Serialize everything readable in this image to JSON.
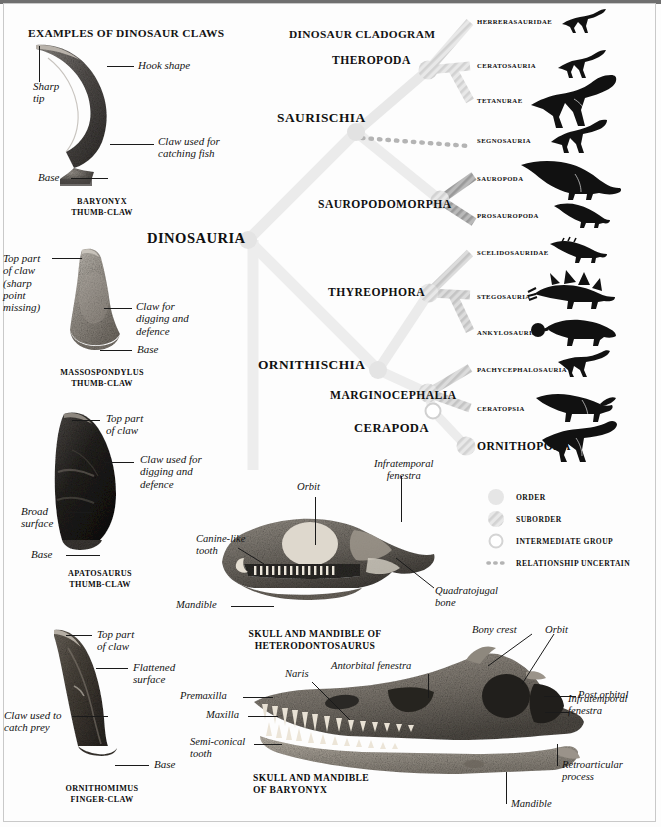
{
  "page": {
    "background": "#fdfdfd",
    "frame_color": "#c9c9c9",
    "top_bar_color": "#6f6f6f"
  },
  "claws_section": {
    "title": "EXAMPLES OF DINOSAUR CLAWS",
    "items": [
      {
        "caption_line1": "BARYONYX",
        "caption_line2": "THUMB-CLAW",
        "labels": [
          {
            "text": "Hook shape",
            "x": 138,
            "y": 62
          },
          {
            "text": "Sharp\ntip",
            "x": 33,
            "y": 82
          },
          {
            "text": "Claw used for\ncatching fish",
            "x": 158,
            "y": 137
          },
          {
            "text": "Base",
            "x": 38,
            "y": 172
          }
        ]
      },
      {
        "caption_line1": "MASSOSPONDYLUS",
        "caption_line2": "THUMB-CLAW",
        "labels": [
          {
            "text": "Top part\nof claw\n(sharp\npoint\nmissing)",
            "x": 3,
            "y": 255
          },
          {
            "text": "Claw for\ndigging and\ndefence",
            "x": 136,
            "y": 303
          },
          {
            "text": "Base",
            "x": 137,
            "y": 345
          }
        ]
      },
      {
        "caption_line1": "APATOSAURUS",
        "caption_line2": "THUMB-CLAW",
        "labels": [
          {
            "text": "Top part\nof claw",
            "x": 106,
            "y": 410
          },
          {
            "text": "Claw used for\ndigging and\ndefence",
            "x": 140,
            "y": 452
          },
          {
            "text": "Broad\nsurface",
            "x": 21,
            "y": 500
          },
          {
            "text": "Base",
            "x": 31,
            "y": 548
          }
        ]
      },
      {
        "caption_line1": "ORNITHOMIMUS",
        "caption_line2": "FINGER-CLAW",
        "labels": [
          {
            "text": "Top part\nof claw",
            "x": 97,
            "y": 627
          },
          {
            "text": "Flattened\nsurface",
            "x": 133,
            "y": 661
          },
          {
            "text": "Claw used to\ncatch prey",
            "x": 4,
            "y": 710
          },
          {
            "text": "Base",
            "x": 154,
            "y": 760
          }
        ]
      }
    ]
  },
  "cladogram": {
    "title": "DINOSAUR CLADOGRAM",
    "root_label": "DINOSAURIA",
    "nodes": [
      {
        "name": "THEROPODA",
        "x": 332,
        "y": 54,
        "size": 11.6
      },
      {
        "name": "SAURISCHIA",
        "x": 277,
        "y": 110,
        "size": 13.4
      },
      {
        "name": "SAUROPODOMORPHA",
        "x": 318,
        "y": 198,
        "size": 11.6
      },
      {
        "name": "DINOSAURIA",
        "x": 147,
        "y": 230,
        "size": 14.6
      },
      {
        "name": "THYREOPHORA",
        "x": 328,
        "y": 286,
        "size": 11.6
      },
      {
        "name": "ORNITHISCHIA",
        "x": 258,
        "y": 357,
        "size": 13.4
      },
      {
        "name": "MARGINOCEPHALIA",
        "x": 330,
        "y": 389,
        "size": 11.6
      },
      {
        "name": "CERAPODA",
        "x": 354,
        "y": 421,
        "size": 12.6
      }
    ],
    "terminals": [
      {
        "label": "HERRERASAURIDAE",
        "y": 22,
        "size": 6.7,
        "sil": "theropod-small"
      },
      {
        "label": "CERATOSAURIA",
        "y": 66,
        "size": 6.7,
        "sil": "theropod-small"
      },
      {
        "label": "TETANURAE",
        "y": 101,
        "size": 6.7,
        "sil": "theropod-large"
      },
      {
        "label": "SEGNOSAURIA",
        "y": 141,
        "size": 6.7,
        "sil": "segnosaur"
      },
      {
        "label": "SAUROPODA",
        "y": 179,
        "size": 6.7,
        "sil": "sauropod"
      },
      {
        "label": "PROSAUROPODA",
        "y": 216,
        "size": 6.7,
        "sil": "prosauropod"
      },
      {
        "label": "SCELIDOSAURIDAE",
        "y": 253,
        "size": 6.7,
        "sil": "scelidosaur"
      },
      {
        "label": "STEGOSAURIA",
        "y": 297,
        "size": 6.7,
        "sil": "stegosaur"
      },
      {
        "label": "ANKYLOSAURIA",
        "y": 333,
        "size": 6.7,
        "sil": "ankylosaur"
      },
      {
        "label": "PACHYCEPHALOSAURIA",
        "y": 370,
        "size": 6.7,
        "sil": "pachycephalosaur"
      },
      {
        "label": "CERATOPSIA",
        "y": 409,
        "size": 6.7,
        "sil": "ceratopsian"
      },
      {
        "label": "ORNITHOPODA",
        "y": 447,
        "size": 11.6,
        "sil": "ornithopod"
      }
    ]
  },
  "legend": {
    "items": [
      {
        "label": "ORDER",
        "marker": "order-blob"
      },
      {
        "label": "SUBORDER",
        "marker": "suborder-striped-blob"
      },
      {
        "label": "INTERMEDIATE GROUP",
        "marker": "hollow-circle"
      },
      {
        "label": "RELATIONSHIP UNCERTAIN",
        "marker": "dotted-line"
      }
    ]
  },
  "heterodontosaurus_skull": {
    "caption_line1": "SKULL AND MANDIBLE OF",
    "caption_line2": "HETERODONTOSAURUS",
    "labels": [
      {
        "text": "Infratemporal\nfenestra",
        "x": 374,
        "y": 460
      },
      {
        "text": "Orbit",
        "x": 297,
        "y": 483
      },
      {
        "text": "Canine-like\ntooth",
        "x": 196,
        "y": 537
      },
      {
        "text": "Quadratojugal\nbone",
        "x": 435,
        "y": 588
      },
      {
        "text": "Mandible",
        "x": 176,
        "y": 601
      }
    ]
  },
  "baryonyx_skull": {
    "caption_line1": "SKULL AND MANDIBLE",
    "caption_line2": "OF BARYONYX",
    "labels": [
      {
        "text": "Bony crest",
        "x": 472,
        "y": 627
      },
      {
        "text": "Orbit",
        "x": 545,
        "y": 627
      },
      {
        "text": "Antorbital fenestra",
        "x": 331,
        "y": 663
      },
      {
        "text": "Naris",
        "x": 285,
        "y": 671
      },
      {
        "text": "Post orbital",
        "x": 578,
        "y": 671
      },
      {
        "text": "Premaxilla",
        "x": 180,
        "y": 690
      },
      {
        "text": "Infratemporal\nfenestra",
        "x": 568,
        "y": 693
      },
      {
        "text": "Maxilla",
        "x": 206,
        "y": 711
      },
      {
        "text": "Semi-conical\ntooth",
        "x": 190,
        "y": 738
      },
      {
        "text": "Retroarticular\nprocess",
        "x": 562,
        "y": 762
      },
      {
        "text": "Mandible",
        "x": 511,
        "y": 800
      }
    ]
  }
}
